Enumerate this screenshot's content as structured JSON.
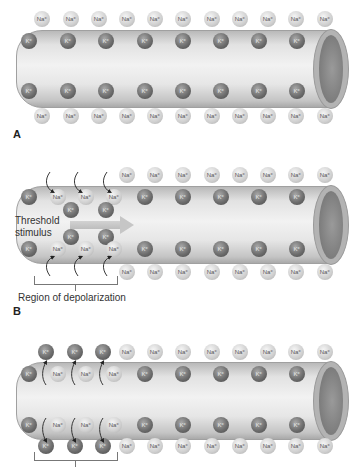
{
  "panels": [
    {
      "letter": "A",
      "na_label": "Na+",
      "k_label": "K+",
      "description": "Resting axon"
    },
    {
      "letter": "B",
      "na_label": "Na+",
      "k_label": "K+",
      "stimulus_label_line1": "Threshold",
      "stimulus_label_line2": "stimulus",
      "region_label": "Region of depolarization"
    },
    {
      "letter": "",
      "na_label": "Na+",
      "k_label": "K+"
    }
  ],
  "ions": {
    "na": "Na⁺",
    "k": "K⁺"
  },
  "colors": {
    "axon_light": "#f2f2f2",
    "axon_dark": "#a9a9a9",
    "na_ion": "#cfcfcf",
    "k_ion": "#6e6e6e",
    "text": "#333333"
  }
}
